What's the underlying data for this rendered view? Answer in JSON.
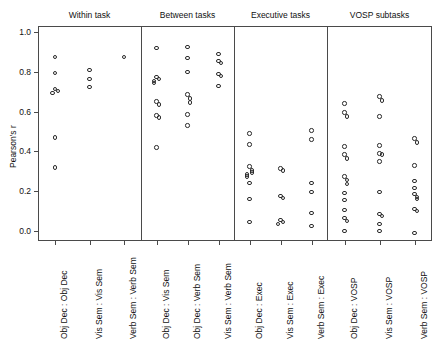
{
  "figure": {
    "ylabel": "Pearson's r",
    "y_ticks": [
      "0.0",
      "0.2",
      "0.4",
      "0.6",
      "0.8",
      "1.0"
    ]
  },
  "chart_data": {
    "type": "scatter",
    "title": "",
    "xlabel": "",
    "ylabel": "Pearson's r",
    "ylim": [
      -0.05,
      1.03
    ],
    "grid": false,
    "legend": null,
    "panels": [
      {
        "label": "Within task",
        "groups": [
          {
            "label": "Obj Dec : Obj Dec",
            "values": [
              0.875,
              0.795,
              0.715,
              0.705,
              0.695,
              0.47,
              0.32
            ]
          },
          {
            "label": "Vis Sem : Vis Sem",
            "values": [
              0.81,
              0.765,
              0.725
            ]
          },
          {
            "label": "Verb Sem : Verb Sem",
            "values": [
              0.875
            ]
          }
        ]
      },
      {
        "label": "Between tasks",
        "groups": [
          {
            "label": "Obj Dec : Vis Sem",
            "values": [
              0.92,
              0.775,
              0.765,
              0.755,
              0.745,
              0.65,
              0.635,
              0.58,
              0.57,
              0.42
            ]
          },
          {
            "label": "Obj Dec : Verb Sem",
            "values": [
              0.925,
              0.87,
              0.8,
              0.685,
              0.665,
              0.645,
              0.585,
              0.53
            ]
          },
          {
            "label": "Vis Sem : Verb Sem",
            "values": [
              0.89,
              0.855,
              0.845,
              0.79,
              0.78,
              0.73
            ]
          }
        ]
      },
      {
        "label": "Executive tasks",
        "groups": [
          {
            "label": "Obj Dec : Exec",
            "values": [
              0.49,
              0.435,
              0.325,
              0.305,
              0.295,
              0.285,
              0.275,
              0.24,
              0.16,
              0.045
            ]
          },
          {
            "label": "Vis Sem : Exec",
            "values": [
              0.315,
              0.305,
              0.175,
              0.165,
              0.055,
              0.045,
              0.035
            ]
          },
          {
            "label": "Verb Sem : Exec",
            "values": [
              0.505,
              0.46,
              0.24,
              0.195,
              0.09,
              0.025
            ]
          }
        ]
      },
      {
        "label": "VOSP subtasks",
        "groups": [
          {
            "label": "Obj Dec : VOSP",
            "values": [
              0.64,
              0.595,
              0.575,
              0.425,
              0.385,
              0.365,
              0.275,
              0.255,
              0.235,
              0.19,
              0.155,
              0.105,
              0.065,
              0.05,
              0.0
            ]
          },
          {
            "label": "Vis Sem : VOSP",
            "values": [
              0.675,
              0.655,
              0.575,
              0.43,
              0.39,
              0.385,
              0.35,
              0.195,
              0.085,
              0.075,
              0.035,
              0.0
            ]
          },
          {
            "label": "Verb Sem : VOSP",
            "values": [
              0.465,
              0.445,
              0.33,
              0.25,
              0.215,
              0.185,
              0.17,
              0.16,
              0.11,
              0.1,
              -0.01
            ]
          }
        ]
      }
    ]
  }
}
